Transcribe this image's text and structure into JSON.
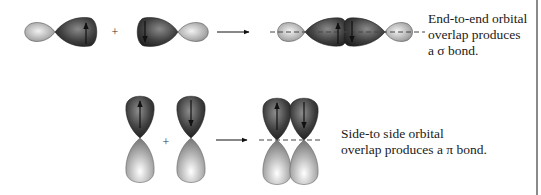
{
  "figure": {
    "sigma": {
      "operator": "+",
      "caption_lines": [
        "End-to-end orbital",
        "overlap produces",
        "a σ bond."
      ],
      "orbital_left_spin": "up",
      "orbital_right_spin": "down"
    },
    "pi": {
      "operator": "+",
      "caption_lines": [
        "Side-to side orbital",
        "overlap produces a π bond."
      ],
      "orbital_left_spin": "up",
      "orbital_right_spin": "down"
    },
    "colors": {
      "dark_lobe": "#3a3a3a",
      "light_lobe": "#b8b8b8",
      "background": "#ffffff",
      "text": "#1a1a1a",
      "frame": "#8a8a8a"
    }
  }
}
